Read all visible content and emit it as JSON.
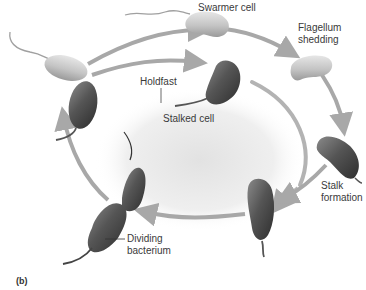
{
  "figure": {
    "panel_label": "(b)"
  },
  "labels": {
    "swarmer_cell": "Swarmer cell",
    "flagellum_shedding_1": "Flagellum",
    "flagellum_shedding_2": "shedding",
    "holdfast": "Holdfast",
    "stalked_cell": "Stalked cell",
    "stalk_formation_1": "Stalk",
    "stalk_formation_2": "formation",
    "dividing_bacterium_1": "Dividing",
    "dividing_bacterium_2": "bacterium"
  },
  "colors": {
    "arrow": "#a8a8a8",
    "swarmer_cell": "#c9c9c9",
    "stalked_cell": "#5a5a5a",
    "background_blob": "#ececec"
  },
  "stages": [
    "Dividing bacterium",
    "Swarmer cell",
    "Flagellum shedding",
    "Stalk formation",
    "Stalked cell"
  ]
}
